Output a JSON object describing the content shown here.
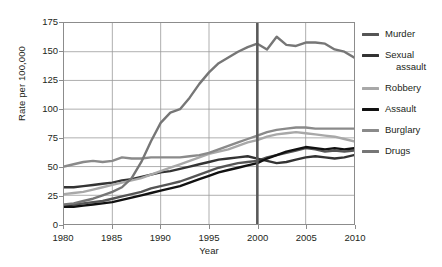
{
  "chart_data": {
    "type": "line",
    "title": "",
    "xlabel": "Year",
    "ylabel": "Rate per 100,000",
    "xlim": [
      1980,
      2010
    ],
    "ylim": [
      0,
      175
    ],
    "yticks": [
      0,
      25,
      50,
      75,
      100,
      125,
      150,
      175
    ],
    "xticks": [
      1980,
      1985,
      1990,
      1995,
      2000,
      2005,
      2010
    ],
    "grid": true,
    "legend_position": "right",
    "annotations": [
      {
        "type": "vertical-line",
        "x": 2000,
        "color": "#595959",
        "label": ""
      }
    ],
    "x": [
      1980,
      1981,
      1982,
      1983,
      1984,
      1985,
      1986,
      1987,
      1988,
      1989,
      1990,
      1991,
      1992,
      1993,
      1994,
      1995,
      1996,
      1997,
      1998,
      1999,
      2000,
      2001,
      2002,
      2003,
      2004,
      2005,
      2006,
      2007,
      2008,
      2009,
      2010
    ],
    "series": [
      {
        "name": "Murder",
        "color": "#555555",
        "values": [
          16,
          17,
          18,
          19,
          20,
          22,
          24,
          26,
          28,
          31,
          33,
          35,
          37,
          40,
          43,
          46,
          49,
          51,
          53,
          54,
          55,
          58,
          60,
          62,
          64,
          66,
          65,
          63,
          64,
          63,
          64
        ]
      },
      {
        "name": "Sexual assault",
        "color": "#333333",
        "values": [
          32,
          32,
          33,
          34,
          35,
          36,
          38,
          39,
          41,
          43,
          45,
          46,
          48,
          50,
          52,
          54,
          56,
          57,
          58,
          59,
          57,
          55,
          53,
          54,
          56,
          58,
          59,
          58,
          57,
          58,
          60
        ]
      },
      {
        "name": "Robbery",
        "color": "#a8a8a8",
        "values": [
          26,
          27,
          28,
          30,
          32,
          34,
          36,
          38,
          40,
          43,
          46,
          49,
          52,
          55,
          58,
          61,
          63,
          65,
          68,
          71,
          73,
          76,
          78,
          79,
          80,
          79,
          78,
          77,
          76,
          74,
          72
        ]
      },
      {
        "name": "Assault",
        "color": "#111111",
        "values": [
          15,
          15,
          16,
          17,
          18,
          19,
          21,
          23,
          25,
          27,
          29,
          31,
          33,
          36,
          39,
          42,
          45,
          47,
          49,
          51,
          53,
          57,
          60,
          63,
          65,
          67,
          66,
          65,
          66,
          65,
          66
        ]
      },
      {
        "name": "Burglary",
        "color": "#8a8a8a",
        "values": [
          50,
          52,
          54,
          55,
          54,
          55,
          58,
          57,
          57,
          58,
          58,
          58,
          58,
          59,
          60,
          62,
          65,
          68,
          71,
          74,
          77,
          80,
          82,
          83,
          84,
          84,
          83,
          83,
          83,
          83,
          83
        ]
      },
      {
        "name": "Drugs",
        "color": "#767676",
        "values": [
          17,
          18,
          20,
          22,
          25,
          28,
          32,
          40,
          54,
          72,
          88,
          97,
          100,
          110,
          122,
          132,
          140,
          145,
          150,
          154,
          157,
          152,
          163,
          156,
          155,
          158,
          158,
          157,
          152,
          150,
          145
        ]
      }
    ]
  },
  "legend": {
    "items": [
      {
        "label": "Murder",
        "label_line2": ""
      },
      {
        "label": "Sexual",
        "label_line2": "assault"
      },
      {
        "label": "Robbery",
        "label_line2": ""
      },
      {
        "label": "Assault",
        "label_line2": ""
      },
      {
        "label": "Burglary",
        "label_line2": ""
      },
      {
        "label": "Drugs",
        "label_line2": ""
      }
    ]
  }
}
